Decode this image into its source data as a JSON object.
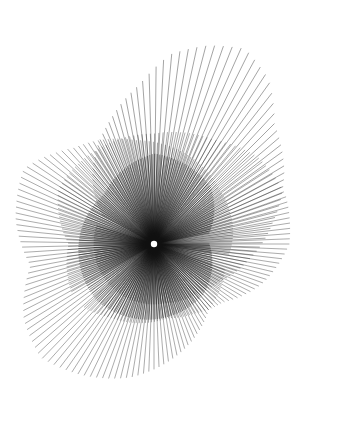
{
  "artwork": {
    "description": "Radial line-art burst composed of overlapping petal-shaped layers",
    "background": "#ffffff",
    "stroke_color": "#111111",
    "center": {
      "x": 154,
      "y": 244
    },
    "center_dot": {
      "r": 3.2,
      "color": "#ffffff"
    },
    "layers": [
      {
        "name": "upper-right-lobe",
        "rays": 150,
        "opacity": 0.55,
        "width": 0.7,
        "outline": [
          [
            0,
            60
          ],
          [
            20,
            95
          ],
          [
            40,
            130
          ],
          [
            55,
            160
          ],
          [
            65,
            190
          ],
          [
            75,
            205
          ],
          [
            85,
            215
          ],
          [
            95,
            200
          ],
          [
            105,
            170
          ],
          [
            120,
            150
          ],
          [
            140,
            120
          ],
          [
            160,
            95
          ],
          [
            180,
            75
          ],
          [
            200,
            65
          ],
          [
            230,
            60
          ],
          [
            260,
            60
          ],
          [
            290,
            60
          ],
          [
            320,
            60
          ],
          [
            350,
            60
          ]
        ]
      },
      {
        "name": "upper-left-lobe",
        "rays": 160,
        "opacity": 0.5,
        "width": 0.7,
        "outline": [
          [
            0,
            95
          ],
          [
            30,
            85
          ],
          [
            60,
            110
          ],
          [
            90,
            110
          ],
          [
            120,
            110
          ],
          [
            150,
            120
          ],
          [
            170,
            135
          ],
          [
            190,
            140
          ],
          [
            210,
            135
          ],
          [
            230,
            115
          ],
          [
            250,
            90
          ],
          [
            270,
            80
          ],
          [
            290,
            75
          ],
          [
            310,
            80
          ],
          [
            330,
            85
          ],
          [
            350,
            95
          ]
        ]
      },
      {
        "name": "lower-lobe",
        "rays": 150,
        "opacity": 0.5,
        "width": 0.7,
        "outline": [
          [
            0,
            75
          ],
          [
            30,
            85
          ],
          [
            60,
            115
          ],
          [
            80,
            135
          ],
          [
            100,
            150
          ],
          [
            115,
            160
          ],
          [
            130,
            150
          ],
          [
            150,
            125
          ],
          [
            170,
            140
          ],
          [
            190,
            150
          ],
          [
            210,
            125
          ],
          [
            240,
            105
          ],
          [
            270,
            95
          ],
          [
            300,
            85
          ],
          [
            330,
            80
          ],
          [
            350,
            75
          ]
        ]
      },
      {
        "name": "inner-core",
        "rays": 220,
        "opacity": 0.6,
        "width": 0.8,
        "outline": [
          [
            0,
            55
          ],
          [
            45,
            70
          ],
          [
            90,
            75
          ],
          [
            135,
            80
          ],
          [
            180,
            75
          ],
          [
            225,
            70
          ],
          [
            270,
            90
          ],
          [
            315,
            80
          ],
          [
            350,
            55
          ]
        ]
      }
    ]
  }
}
